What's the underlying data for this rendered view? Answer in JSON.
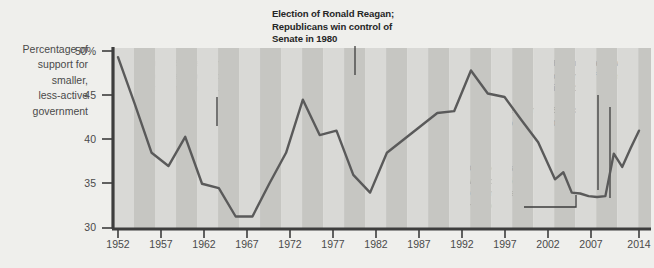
{
  "axis": {
    "y_title": "Percentage of support for smaller, less-active government",
    "y_title_lines": [
      "Percentage of",
      "support for",
      "smaller,",
      "less-active",
      "government"
    ],
    "y_ticks": [
      "50%",
      "45",
      "40",
      "35",
      "30"
    ],
    "x_ticks": [
      "1952",
      "1957",
      "1962",
      "1967",
      "1972",
      "1977",
      "1982",
      "1987",
      "1992",
      "1997",
      "2002",
      "2007",
      "2014"
    ]
  },
  "annotations": [
    {
      "id": "great-society",
      "lines": [
        "Great Society and",
        "expansion of federal",
        "government in 1964"
      ],
      "year": 1964
    },
    {
      "id": "reagan-election",
      "lines": [
        "Election of Ronald Reagan;",
        "Republicans win control of",
        "Senate in 1980"
      ],
      "year": 1980
    },
    {
      "id": "democrats-congress",
      "lines": [
        "Democrats",
        "win control",
        "of Congress",
        "in 2006"
      ],
      "year": 2006
    },
    {
      "id": "obama-election",
      "lines": [
        "Election of Barack",
        "Obama in 2008"
      ],
      "year": 2008
    },
    {
      "id": "republicans-house",
      "lines": [
        "Republicans win",
        "control of House",
        "in 2010"
      ],
      "year": 2010
    }
  ],
  "colors": {
    "background": "#efefec",
    "plot_band_light": "#d9d9d6",
    "plot_band_dark": "#c6c6c2",
    "line": "#5a5a5a",
    "axis": "#3d3d3d",
    "text": "#4a4a4a",
    "annotation_text": "#262626"
  },
  "chart_data": {
    "type": "line",
    "title": "",
    "xlabel": "",
    "ylabel": "Percentage of support for smaller, less-active government",
    "xlim": [
      1952,
      2014
    ],
    "ylim": [
      30,
      50
    ],
    "grid": false,
    "legend": "none",
    "x": [
      1952,
      1954,
      1956,
      1958,
      1960,
      1962,
      1964,
      1966,
      1968,
      1970,
      1972,
      1974,
      1976,
      1978,
      1980,
      1982,
      1984,
      1986,
      1988,
      1990,
      1992,
      1994,
      1996,
      1998,
      2000,
      2002,
      2004,
      2006,
      2008,
      2010,
      2012,
      2014
    ],
    "y": [
      49.3,
      44.0,
      38.5,
      37.0,
      40.3,
      35.0,
      34.5,
      31.3,
      31.3,
      35.0,
      38.5,
      44.5,
      40.5,
      41.0,
      36.0,
      34.0,
      38.5,
      40.0,
      41.5,
      43.0,
      43.2,
      47.8,
      45.2,
      44.8,
      42.2,
      39.7,
      39.0,
      35.3,
      33.8,
      36.3,
      35.0,
      33.3
    ],
    "series": [
      {
        "name": "Support for smaller, less-active government",
        "values": [
          49.3,
          44.0,
          38.5,
          37.0,
          40.3,
          35.0,
          34.5,
          31.3,
          31.3,
          35.0,
          38.5,
          44.5,
          40.5,
          41.0,
          36.0,
          34.0,
          38.5,
          40.0,
          41.5,
          43.0,
          43.2,
          47.8,
          45.2,
          44.8,
          42.2,
          39.7,
          39.0,
          35.3,
          33.8,
          36.3,
          35.0,
          33.3
        ]
      }
    ],
    "extra_points": {
      "x": [
        2009,
        2010,
        2011,
        2012,
        2013,
        2014
      ],
      "y": [
        33.3,
        33.4,
        38.0,
        36.6,
        38.8,
        41.0
      ]
    },
    "full_x": [
      1952,
      1954,
      1956,
      1958,
      1960,
      1962,
      1964,
      1966,
      1968,
      1970,
      1972,
      1974,
      1976,
      1978,
      1980,
      1982,
      1984,
      1986,
      1988,
      1990,
      1992,
      1994,
      1996,
      1998,
      2000,
      2002,
      2004,
      2005,
      2006,
      2007,
      2008,
      2009,
      2010,
      2011,
      2012,
      2013,
      2014
    ],
    "full_y": [
      49.3,
      44.0,
      38.5,
      37.0,
      40.3,
      35.0,
      34.5,
      31.3,
      31.3,
      35.0,
      38.5,
      44.5,
      40.5,
      41.0,
      36.0,
      34.0,
      38.5,
      40.0,
      41.5,
      43.0,
      43.2,
      47.8,
      45.2,
      44.8,
      42.2,
      39.7,
      35.5,
      36.3,
      34.0,
      33.9,
      33.6,
      33.5,
      33.6,
      38.4,
      36.9,
      39.0,
      41.0
    ]
  }
}
